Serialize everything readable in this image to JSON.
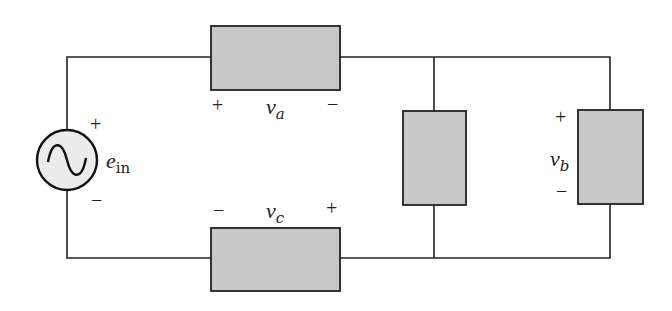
{
  "diagram": {
    "type": "circuit",
    "colors": {
      "wire": "#222222",
      "component_fill": "#c8c8c8",
      "source_fill": "#ececec"
    },
    "source": {
      "symbol": "ac-voltage-source",
      "label_main": "e",
      "label_sub": "in",
      "plus": "+",
      "minus": "−"
    },
    "components": [
      {
        "id": "a",
        "orientation": "horizontal",
        "position": "top",
        "var": "v",
        "sub": "a",
        "plus": "+",
        "minus": "−"
      },
      {
        "id": "c",
        "orientation": "horizontal",
        "position": "bottom",
        "var": "v",
        "sub": "c",
        "plus": "+",
        "minus": "−"
      },
      {
        "id": "middle",
        "orientation": "vertical",
        "position": "middle-shunt"
      },
      {
        "id": "b",
        "orientation": "vertical",
        "position": "right-shunt",
        "var": "v",
        "sub": "b",
        "plus": "+",
        "minus": "−"
      }
    ]
  }
}
